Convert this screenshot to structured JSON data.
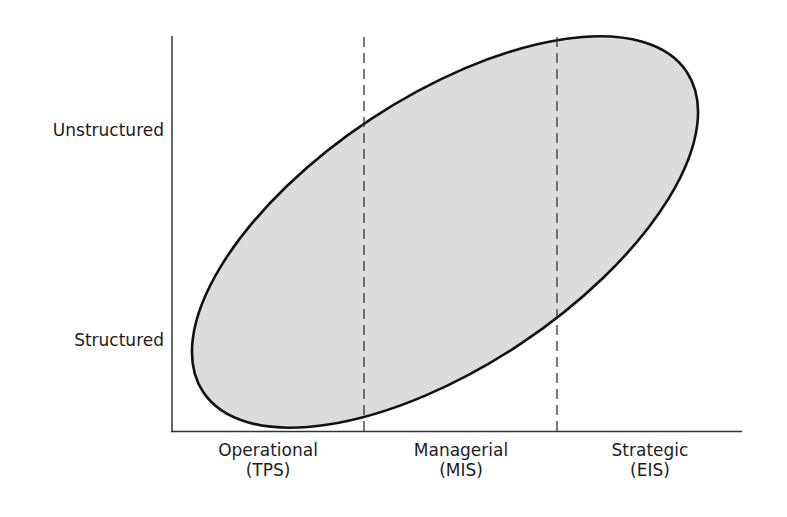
{
  "diagram": {
    "type": "conceptual-ellipse-chart",
    "y_axis": {
      "labels": [
        {
          "text": "Unstructured"
        },
        {
          "text": "Structured"
        }
      ]
    },
    "x_axis": {
      "categories": [
        {
          "line1": "Operational",
          "line2": "(TPS)"
        },
        {
          "line1": "Managerial",
          "line2": "(MIS)"
        },
        {
          "line1": "Strategic",
          "line2": "(EIS)"
        }
      ]
    },
    "region": {
      "shape": "ellipse",
      "fill": "#dcdcdc",
      "stroke": "#111111"
    },
    "dividers": {
      "style": "dashed",
      "count": 2,
      "color": "#333333"
    },
    "axis_color": "#333333"
  }
}
